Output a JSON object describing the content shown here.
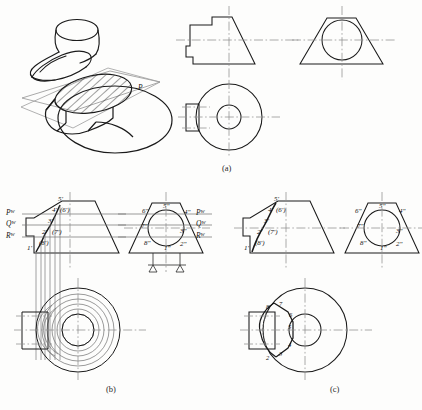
{
  "figure": {
    "stroke_color": "#1a1a1a",
    "center_line_color": "#8a8a8a",
    "light_line_color": "#9a9a9a",
    "hatch_color": "#2a2a2a",
    "background": "#fdfdfc"
  },
  "captions": {
    "a": "(a)",
    "b": "(b)",
    "c": "(c)"
  },
  "panel_a": {
    "name": "pictorial-and-three-views",
    "pictorial": {
      "plane_label": "P"
    },
    "views": {
      "front": "front-view",
      "side": "side-view",
      "top": "top-view"
    }
  },
  "panel_b": {
    "name": "construction-with-auxiliary-planes",
    "trace_labels_left": [
      {
        "letter": "P",
        "sub": "W"
      },
      {
        "letter": "Q",
        "sub": "W"
      },
      {
        "letter": "R",
        "sub": "W"
      }
    ],
    "trace_labels_right": [
      {
        "letter": "P",
        "sub": "W"
      },
      {
        "letter": "Q",
        "sub": "W"
      },
      {
        "letter": "R",
        "sub": "W"
      }
    ],
    "front_points": [
      "5'",
      "4'",
      "(6')",
      "3'",
      "2'",
      "(7')",
      "1'",
      "(8')"
    ],
    "side_points": [
      "6\"",
      "5\"",
      "4\"",
      "7\"",
      "3\"",
      "8\"",
      "1\"",
      "2\""
    ]
  },
  "panel_c": {
    "name": "finished-curve",
    "front_points": [
      "5'",
      "4'",
      "(6')",
      "3'",
      "2'",
      "(7')",
      "1'",
      "(8')"
    ],
    "side_points": [
      "6\"",
      "5\"",
      "4\"",
      "7\"",
      "3\"",
      "8\"",
      "1\"",
      "2\""
    ],
    "top_points": [
      "8",
      "7",
      "6",
      "5",
      "4",
      "3",
      "2"
    ]
  }
}
